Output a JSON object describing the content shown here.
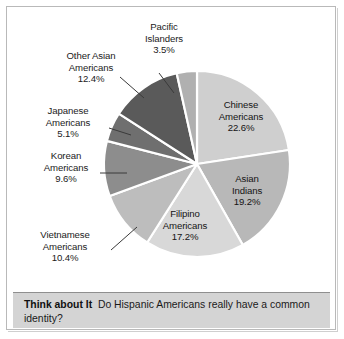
{
  "figure": {
    "background_color": "#ffffff",
    "border_color": "#b9b9b9"
  },
  "caption": {
    "lead_label": "Think about It",
    "question": "Do Hispanic Americans really have a common identity?",
    "background_color": "#d4d4d4"
  },
  "chart_data": {
    "type": "pie",
    "title": "",
    "subtitle": "",
    "xlabel": "",
    "ylabel": "",
    "legend_position": "none",
    "grid": false,
    "start_angle_deg": 0,
    "direction": "clockwise",
    "unit": "percent",
    "total": 100.0,
    "categories": [
      "Chinese Americans",
      "Asian Indians",
      "Filipino Americans",
      "Vietnamese Americans",
      "Korean Americans",
      "Japanese Americans",
      "Other Asian Americans",
      "Pacific Islanders"
    ],
    "values": [
      22.6,
      19.2,
      17.2,
      10.4,
      9.6,
      5.1,
      12.4,
      3.5
    ],
    "slices": [
      {
        "name": "Chinese Americans",
        "name_line1": "Chinese",
        "name_line2": "Americans",
        "value": 22.6,
        "value_label": "22.6%",
        "color": "#cfcfcf",
        "label_placement": "inside"
      },
      {
        "name": "Asian Indians",
        "name_line1": "Asian",
        "name_line2": "Indians",
        "value": 19.2,
        "value_label": "19.2%",
        "color": "#b8b8b8",
        "label_placement": "inside"
      },
      {
        "name": "Filipino Americans",
        "name_line1": "Filipino",
        "name_line2": "Americans",
        "value": 17.2,
        "value_label": "17.2%",
        "color": "#d8d8d8",
        "label_placement": "inside"
      },
      {
        "name": "Vietnamese Americans",
        "name_line1": "Vietnamese",
        "name_line2": "Americans",
        "value": 10.4,
        "value_label": "10.4%",
        "color": "#bdbdbd",
        "label_placement": "outside-leader"
      },
      {
        "name": "Korean Americans",
        "name_line1": "Korean",
        "name_line2": "Americans",
        "value": 9.6,
        "value_label": "9.6%",
        "color": "#8d8d8d",
        "label_placement": "outside-leader"
      },
      {
        "name": "Japanese Americans",
        "name_line1": "Japanese",
        "name_line2": "Americans",
        "value": 5.1,
        "value_label": "5.1%",
        "color": "#6f6f6f",
        "label_placement": "outside-leader"
      },
      {
        "name": "Other Asian Americans",
        "name_line1": "Other Asian",
        "name_line2": "Americans",
        "value": 12.4,
        "value_label": "12.4%",
        "color": "#5a5a5a",
        "label_placement": "outside-leader"
      },
      {
        "name": "Pacific Islanders",
        "name_line1": "Pacific",
        "name_line2": "Islanders",
        "value": 3.5,
        "value_label": "3.5%",
        "color": "#b0b0b0",
        "label_placement": "outside-leader"
      }
    ]
  }
}
